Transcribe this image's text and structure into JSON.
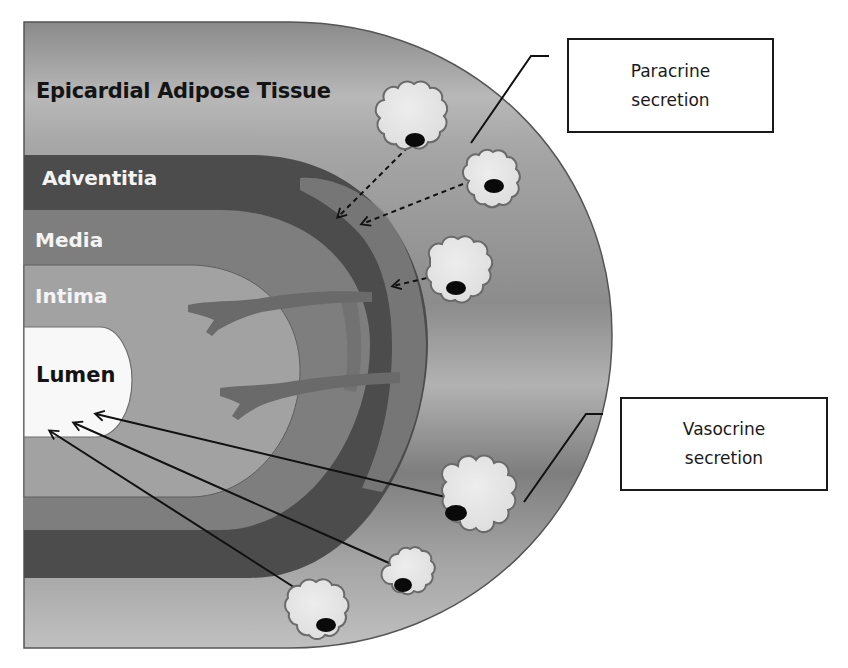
{
  "figure": {
    "colors": {
      "background": "#ffffff",
      "eat_light": "#b4b4b4",
      "eat_mid": "#8e8e8e",
      "eat_dark": "#6e6e6e",
      "adventitia": "#4a4a4a",
      "media": "#7e7e7e",
      "intima": "#a0a0a0",
      "lumen": "#f8f8f8",
      "vasa_vasorum": "#6c6c6c",
      "adipocyte_fill": "#e6e6e6",
      "adipocyte_outline": "#6a6a6a",
      "nucleus": "#0a0a0a",
      "line": "#111111"
    }
  },
  "layers": {
    "eat": {
      "label": "Epicardial Adipose Tissue"
    },
    "adventitia": {
      "label": "Adventitia"
    },
    "media": {
      "label": "Media"
    },
    "intima": {
      "label": "Intima"
    },
    "lumen": {
      "label": "Lumen"
    }
  },
  "callouts": {
    "paracrine": {
      "line1": "Paracrine",
      "line2": "secretion"
    },
    "vasocrine": {
      "line1": "Vasocrine",
      "line2": "secretion"
    }
  },
  "adipocytes": [
    {
      "id": "paracrine-1",
      "cx": 412,
      "cy": 118,
      "r": 34,
      "nucleus": [
        414,
        142
      ],
      "route": "paracrine"
    },
    {
      "id": "paracrine-2",
      "cx": 490,
      "cy": 178,
      "r": 29,
      "nucleus": [
        494,
        186
      ],
      "route": "paracrine"
    },
    {
      "id": "paracrine-3",
      "cx": 460,
      "cy": 268,
      "r": 34,
      "nucleus": [
        456,
        288
      ],
      "route": "paracrine"
    },
    {
      "id": "vasocrine-1",
      "cx": 480,
      "cy": 492,
      "r": 37,
      "nucleus": [
        456,
        513
      ],
      "route": "vasocrine"
    },
    {
      "id": "vasocrine-2",
      "cx": 411,
      "cy": 574,
      "r": 25,
      "nucleus": [
        403,
        585
      ],
      "route": "vasocrine"
    },
    {
      "id": "vasocrine-3",
      "cx": 318,
      "cy": 607,
      "r": 33,
      "nucleus": [
        326,
        625
      ],
      "route": "vasocrine"
    }
  ],
  "arrows": {
    "paracrine_dashed": [
      {
        "from": [
          408,
          147
        ],
        "to": [
          338,
          217
        ]
      },
      {
        "from": [
          463,
          184
        ],
        "to": [
          362,
          224
        ]
      },
      {
        "from": [
          444,
          274
        ],
        "to": [
          393,
          286
        ]
      }
    ],
    "vasocrine_solid": [
      {
        "from": [
          458,
          500
        ],
        "to": [
          96,
          414
        ]
      },
      {
        "from": [
          398,
          567
        ],
        "to": [
          74,
          423
        ]
      },
      {
        "from": [
          314,
          600
        ],
        "to": [
          50,
          431
        ]
      }
    ]
  }
}
